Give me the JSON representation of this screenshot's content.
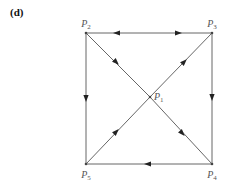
{
  "panel": {
    "label": "(d)"
  },
  "colors": {
    "edge": "#666666",
    "arrow": "#222222",
    "label": "#555555"
  },
  "nodes": [
    {
      "id": "P1",
      "letter": "P",
      "sub": "1",
      "x": 150,
      "y": 97
    },
    {
      "id": "P2",
      "letter": "P",
      "sub": "2",
      "x": 86,
      "y": 33
    },
    {
      "id": "P3",
      "letter": "P",
      "sub": "3",
      "x": 212,
      "y": 33
    },
    {
      "id": "P4",
      "letter": "P",
      "sub": "4",
      "x": 212,
      "y": 164
    },
    {
      "id": "P5",
      "letter": "P",
      "sub": "5",
      "x": 86,
      "y": 164
    }
  ],
  "edges": [
    {
      "from": "P3",
      "to": "P2",
      "arrows": [
        {
          "x": 117,
          "y": 33,
          "dir": "left"
        }
      ]
    },
    {
      "from": "P2",
      "to": "P3",
      "arrows": [
        {
          "x": 178,
          "y": 33,
          "dir": "right"
        }
      ]
    },
    {
      "from": "P2",
      "to": "P5",
      "arrows": [
        {
          "x": 86,
          "y": 98,
          "dir": "down"
        }
      ]
    },
    {
      "from": "P3",
      "to": "P4",
      "arrows": [
        {
          "x": 212,
          "y": 97,
          "dir": "down"
        }
      ]
    },
    {
      "from": "P4",
      "to": "P5",
      "arrows": [
        {
          "x": 148,
          "y": 164,
          "dir": "left"
        }
      ]
    },
    {
      "from": "P2",
      "to": "P1",
      "arrows": [
        {
          "x": 116,
          "y": 62,
          "dir": "down-right"
        }
      ]
    },
    {
      "from": "P1",
      "to": "P3",
      "arrows": [
        {
          "x": 184,
          "y": 62,
          "dir": "up-right"
        }
      ]
    },
    {
      "from": "P1",
      "to": "P4",
      "arrows": [
        {
          "x": 182,
          "y": 133,
          "dir": "down-right"
        }
      ]
    },
    {
      "from": "P5",
      "to": "P1",
      "arrows": [
        {
          "x": 116,
          "y": 132,
          "dir": "up-right"
        }
      ]
    }
  ]
}
